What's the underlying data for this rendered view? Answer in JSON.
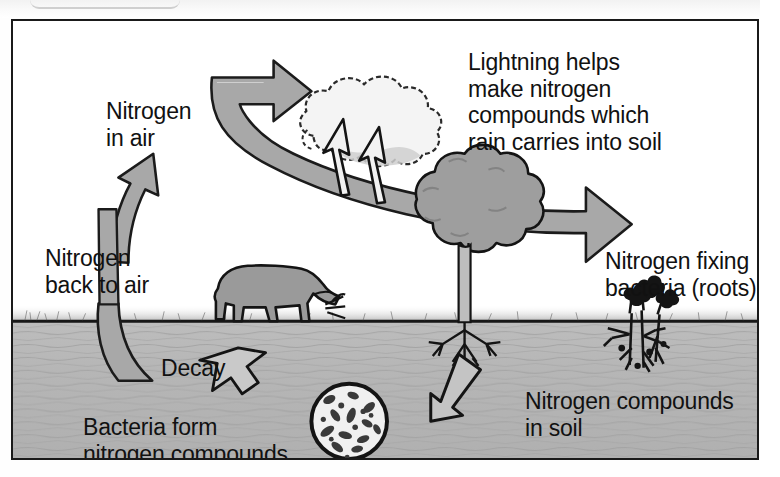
{
  "diagram": {
    "frame": {
      "border_color": "#1a1a1a"
    },
    "colors": {
      "ink": "#111111",
      "arrow_fill": "#a8a8a8",
      "soil": "#b9b9b9",
      "sky": "#ffffff",
      "tree_crown": "#9e9e9e",
      "animal": "#9a9a9a"
    },
    "labels": {
      "nitrogen_in_air": "Nitrogen\nin air",
      "lightning": "Lightning helps\nmake nitrogen\ncompounds which\nrain carries into soil",
      "nitrogen_back_to_air": "Nitrogen\nback to air",
      "decay": "Decay",
      "bacteria_form": "Bacteria form\nnitrogen compounds",
      "nitrogen_fixing": "Nitrogen fixing\nbacteria (roots)",
      "nitrogen_compounds_soil": "Nitrogen compounds\nin soil"
    },
    "elements": [
      {
        "name": "cloud",
        "kind": "illustration"
      },
      {
        "name": "lightning-bolt-left",
        "kind": "illustration"
      },
      {
        "name": "lightning-bolt-right",
        "kind": "illustration"
      },
      {
        "name": "sky-arc-arrow",
        "kind": "arrow",
        "direction": "left-and-down-right"
      },
      {
        "name": "uptake-arrow",
        "kind": "arrow",
        "direction": "up"
      },
      {
        "name": "return-arrow",
        "kind": "arrow",
        "direction": "down"
      },
      {
        "name": "decay-arrow",
        "kind": "arrow",
        "direction": "down-left"
      },
      {
        "name": "root-arrow",
        "kind": "arrow",
        "direction": "down-left"
      },
      {
        "name": "tree",
        "kind": "illustration"
      },
      {
        "name": "grazing-animal",
        "kind": "illustration"
      },
      {
        "name": "bacteria-circle",
        "kind": "illustration"
      },
      {
        "name": "nodule-plants",
        "kind": "illustration"
      },
      {
        "name": "ground-line",
        "kind": "divider"
      }
    ]
  }
}
